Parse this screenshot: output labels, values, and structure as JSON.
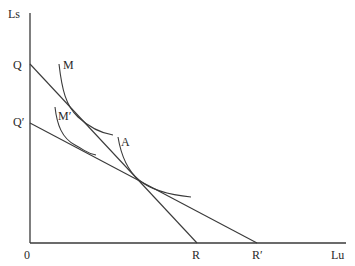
{
  "diagram": {
    "type": "indifference-curve-budget-line-diagram",
    "axes": {
      "y_label": "Ls",
      "x_label": "Lu",
      "origin_label": "0"
    },
    "lines": [
      {
        "name": "QR",
        "start_label": "Q",
        "end_label": "R"
      },
      {
        "name": "Q'R'",
        "start_label": "Q′",
        "end_label": "R′"
      }
    ],
    "curves": [
      {
        "name": "M",
        "label": "M"
      },
      {
        "name": "M'",
        "label": "M′"
      },
      {
        "name": "A",
        "label": "A"
      }
    ],
    "colors": {
      "line": "#3a3a3a",
      "text": "#2a2a2a",
      "background": "#ffffff"
    }
  }
}
